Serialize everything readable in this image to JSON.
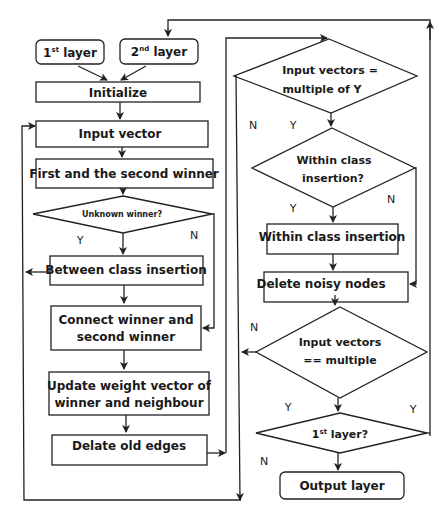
{
  "diagram": {
    "type": "flowchart",
    "nodes": {
      "layer1": {
        "label": "1",
        "sup": "st",
        "suffix": " layer"
      },
      "layer2": {
        "label": "2",
        "sup": "nd",
        "suffix": " layer"
      },
      "initialize": {
        "label": "Initialize"
      },
      "input_vector": {
        "label": "Input vector"
      },
      "first_second_winner": {
        "label": "First and the second winner"
      },
      "unknown_winner": {
        "label": "Unknown winner?"
      },
      "between_class": {
        "label": "Between class insertion"
      },
      "connect_winner": {
        "line1": "Connect winner and",
        "line2": "second winner"
      },
      "update_weight": {
        "line1": "Update weight vector of",
        "line2": "winner and neighbour"
      },
      "delate_edges": {
        "label": "Delate old edges"
      },
      "input_multiple_y": {
        "line1": "Input vectors =",
        "line2": "multiple of Y"
      },
      "within_class_q": {
        "line1": "Within class",
        "line2": "insertion?"
      },
      "within_class": {
        "label": "Within class insertion"
      },
      "delete_noisy": {
        "label": "Delete noisy nodes"
      },
      "input_eq_multiple": {
        "line1": "Input vectors",
        "line2": "== multiple"
      },
      "first_layer_q": {
        "label": "1",
        "sup": "st",
        "suffix": " layer?"
      },
      "output_layer": {
        "label": "Output layer"
      }
    },
    "edge_labels": {
      "unknown_y": "Y",
      "unknown_n": "N",
      "multiple_y_n": "N",
      "multiple_y_y": "Y",
      "within_y": "Y",
      "within_n": "N",
      "eq_multiple_n": "N",
      "eq_multiple_y": "Y",
      "first_layer_y": "Y",
      "first_layer_n": "N"
    }
  }
}
